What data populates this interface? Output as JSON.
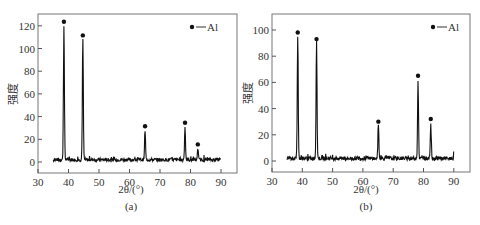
{
  "chart_data": [
    {
      "type": "line",
      "panel": "(a)",
      "caption": "(a)",
      "xlabel": "2θ/(°)",
      "ylabel": "强度",
      "xlim": [
        30,
        95
      ],
      "ylim": [
        -10,
        130
      ],
      "xticks": [
        30,
        40,
        50,
        60,
        70,
        80,
        90
      ],
      "yticks": [
        0,
        20,
        40,
        60,
        80,
        100,
        120
      ],
      "grid": false,
      "legend": {
        "position": "top-right",
        "entries": [
          {
            "marker": "diamond",
            "label": "Al"
          }
        ]
      },
      "series": [
        {
          "name": "Al",
          "peaks": [
            {
              "x": 38.5,
              "y": 120,
              "label": "Al"
            },
            {
              "x": 44.7,
              "y": 108,
              "label": "Al"
            },
            {
              "x": 65.1,
              "y": 28,
              "label": "Al"
            },
            {
              "x": 78.2,
              "y": 31,
              "label": "Al"
            },
            {
              "x": 82.4,
              "y": 12,
              "label": "Al"
            }
          ],
          "baseline": 2,
          "x_range": [
            35,
            90
          ]
        }
      ]
    },
    {
      "type": "line",
      "panel": "(b)",
      "caption": "(b)",
      "xlabel": "2θ/(°)",
      "ylabel": "强度",
      "xlim": [
        30,
        95
      ],
      "ylim": [
        -10,
        110
      ],
      "xticks": [
        30,
        40,
        50,
        60,
        70,
        80,
        90
      ],
      "yticks": [
        0,
        20,
        40,
        60,
        80,
        100
      ],
      "grid": false,
      "legend": {
        "position": "top-right",
        "entries": [
          {
            "marker": "diamond",
            "label": "Al"
          }
        ]
      },
      "series": [
        {
          "name": "Al",
          "peaks": [
            {
              "x": 38.5,
              "y": 95,
              "label": "Al"
            },
            {
              "x": 44.7,
              "y": 90,
              "label": "Al"
            },
            {
              "x": 65.1,
              "y": 27,
              "label": "Al"
            },
            {
              "x": 78.2,
              "y": 62,
              "label": "Al"
            },
            {
              "x": 82.4,
              "y": 29,
              "label": "Al"
            }
          ],
          "baseline": 2,
          "x_range": [
            35,
            90
          ]
        }
      ]
    }
  ],
  "labels": {
    "a": {
      "caption": "(a)",
      "xlabel": "2θ/(°)",
      "ylabel": "强度",
      "legend": "Al"
    },
    "b": {
      "caption": "(b)",
      "xlabel": "2θ/(°)",
      "ylabel": "强度",
      "legend": "Al"
    }
  }
}
